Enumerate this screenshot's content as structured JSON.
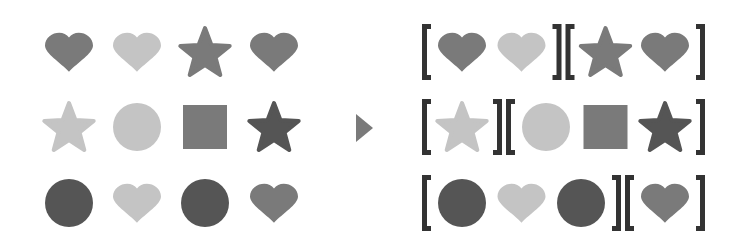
{
  "colors": {
    "dark": "#555555",
    "mid": "#7a7a7a",
    "light": "#c4c4c4",
    "bracket": "#333333",
    "arrow": "#7a7a7a",
    "background": "#ffffff"
  },
  "input_grid": {
    "rows": [
      [
        {
          "shape": "heart",
          "shade": "mid"
        },
        {
          "shape": "heart",
          "shade": "light"
        },
        {
          "shape": "star",
          "shade": "mid"
        },
        {
          "shape": "heart",
          "shade": "mid"
        }
      ],
      [
        {
          "shape": "star",
          "shade": "light"
        },
        {
          "shape": "circle",
          "shade": "light"
        },
        {
          "shape": "square",
          "shade": "mid"
        },
        {
          "shape": "star",
          "shade": "dark"
        }
      ],
      [
        {
          "shape": "circle",
          "shade": "dark"
        },
        {
          "shape": "heart",
          "shade": "light"
        },
        {
          "shape": "circle",
          "shade": "dark"
        },
        {
          "shape": "heart",
          "shade": "mid"
        }
      ]
    ]
  },
  "arrow": {
    "icon": "triangle-right-icon"
  },
  "output_groups": {
    "rows": [
      [
        [
          {
            "shape": "heart",
            "shade": "mid"
          },
          {
            "shape": "heart",
            "shade": "light"
          }
        ],
        [
          {
            "shape": "star",
            "shade": "mid"
          },
          {
            "shape": "heart",
            "shade": "mid"
          }
        ]
      ],
      [
        [
          {
            "shape": "star",
            "shade": "light"
          }
        ],
        [
          {
            "shape": "circle",
            "shade": "light"
          },
          {
            "shape": "square",
            "shade": "mid"
          },
          {
            "shape": "star",
            "shade": "dark"
          }
        ]
      ],
      [
        [
          {
            "shape": "circle",
            "shade": "dark"
          },
          {
            "shape": "heart",
            "shade": "light"
          },
          {
            "shape": "circle",
            "shade": "dark"
          }
        ],
        [
          {
            "shape": "heart",
            "shade": "mid"
          }
        ]
      ]
    ]
  }
}
